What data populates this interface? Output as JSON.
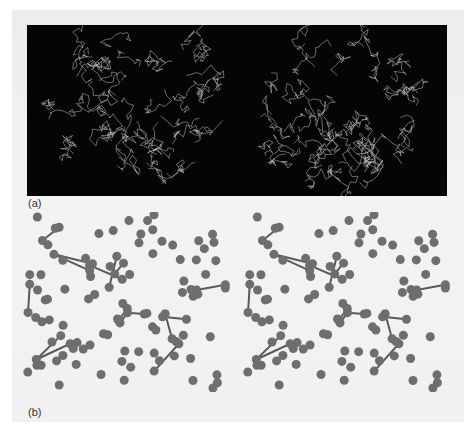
{
  "figure": {
    "panel_a": {
      "label": "(a)",
      "description": "Stereo pair wireframe rendering of protein backbone on black background",
      "background": "#050505",
      "line_color": "#c9c9c9",
      "views": 2
    },
    "panel_b": {
      "label": "(b)",
      "description": "Stereo pair ball-and-stick rendering of atoms on light background",
      "atom_color": "#6e6e6e",
      "bond_color": "#5a5a5a",
      "views": 2
    },
    "colors": {
      "page_background": "#f1f1f1"
    }
  }
}
